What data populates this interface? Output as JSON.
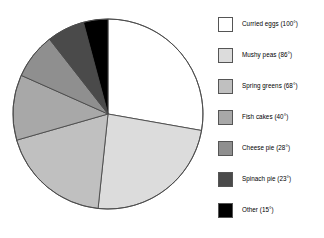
{
  "chart_data": {
    "type": "pie",
    "title": "",
    "units": "degrees",
    "total_degrees": 360,
    "start_angle_deg": 0,
    "direction": "clockwise",
    "legend_position": "right",
    "grid": false,
    "categories": [
      "Curried eggs",
      "Mushy peas",
      "Spring greens",
      "Fish cakes",
      "Cheese pie",
      "Spinach pie",
      "Other"
    ],
    "values": [
      100,
      86,
      68,
      40,
      28,
      23,
      15
    ],
    "colors": [
      "#ffffff",
      "#dcdcdc",
      "#c0c0c0",
      "#a8a8a8",
      "#8f8f8f",
      "#4a4a4a",
      "#000000"
    ],
    "slice_stroke": "#4a4a4a",
    "labels": [
      "Curried eggs (100°)",
      "Mushy peas (86°)",
      "Spring greens (68°)",
      "Fish cakes (40°)",
      "Cheese pie (28°)",
      "Spinach pie (23°)",
      "Other (15°)"
    ]
  },
  "legend": {
    "items": [
      {
        "label": "Curried eggs (100°)",
        "color": "#ffffff",
        "value": 100,
        "name": "curried-eggs"
      },
      {
        "label": "Mushy peas (86°)",
        "color": "#dcdcdc",
        "value": 86,
        "name": "mushy-peas"
      },
      {
        "label": "Spring greens (68°)",
        "color": "#c0c0c0",
        "value": 68,
        "name": "spring-greens"
      },
      {
        "label": "Fish cakes (40°)",
        "color": "#a8a8a8",
        "value": 40,
        "name": "fish-cakes"
      },
      {
        "label": "Cheese pie (28°)",
        "color": "#8f8f8f",
        "value": 28,
        "name": "cheese-pie"
      },
      {
        "label": "Spinach pie (23°)",
        "color": "#4a4a4a",
        "value": 23,
        "name": "spinach-pie"
      },
      {
        "label": "Other (15°)",
        "color": "#000000",
        "value": 15,
        "name": "other"
      }
    ]
  },
  "geometry": {
    "center_x": 108,
    "center_y": 114,
    "radius": 95,
    "legend_item_tops": [
      8,
      39,
      70,
      101,
      132,
      163,
      194
    ]
  }
}
